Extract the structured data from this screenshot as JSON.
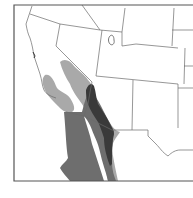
{
  "map": {
    "type": "species-range-map",
    "region": "Southwestern United States and northwestern Mexico",
    "colors": {
      "background": "#ffffff",
      "border": "#555555",
      "state_lines": "#6a6a6a",
      "range_light": "#a9a9a9",
      "range_medium": "#6e6e6e",
      "range_dark": "#3a3a3a"
    },
    "legend": []
  }
}
